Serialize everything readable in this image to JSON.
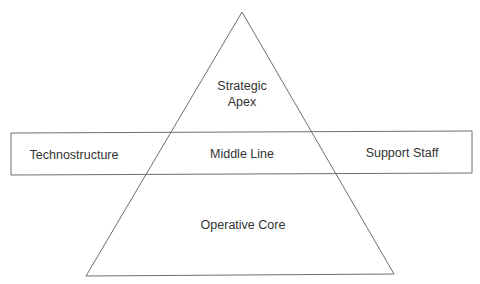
{
  "diagram": {
    "colors": {
      "stroke": "#6e6e6e",
      "text": "#333333",
      "background": "#ffffff"
    },
    "triangle": {
      "apex_label_line1": "Strategic",
      "apex_label_line2": "Apex",
      "base_label": "Operative Core"
    },
    "band": {
      "left_label": "Technostructure",
      "center_label": "Middle Line",
      "right_label": "Support Staff"
    }
  }
}
